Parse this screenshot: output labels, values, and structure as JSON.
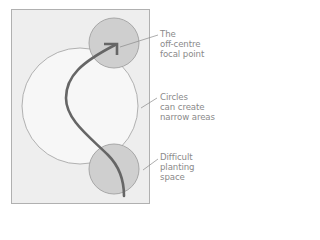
{
  "diagram": {
    "colors": {
      "background": "#ffffff",
      "frame_fill": "#eeeeee",
      "frame_stroke": "#b0b0b0",
      "large_circle_fill": "#f7f7f7",
      "large_circle_stroke": "#a8a8a8",
      "small_circle_fill": "#cfcfcf",
      "small_circle_stroke": "#a0a0a0",
      "path_stroke": "#666666",
      "leader_stroke": "#8a8a8a",
      "label_text": "#8a8a8a"
    },
    "shapes": {
      "frame": {
        "x": 11,
        "y": 9,
        "width": 138,
        "height": 194
      },
      "large_circle": {
        "cx": 80,
        "cy": 106,
        "r": 58
      },
      "top_circle": {
        "cx": 114,
        "cy": 43,
        "r": 25
      },
      "bottom_circle": {
        "cx": 114,
        "cy": 169,
        "r": 25
      }
    },
    "path": {
      "description": "curving garden path ending in arrowhead at focal point",
      "arrow_icon": "arrowhead"
    },
    "labels": [
      {
        "id": "focal-point",
        "lines": [
          "The",
          "off-centre",
          "focal point"
        ]
      },
      {
        "id": "narrow-areas",
        "lines": [
          "Circles",
          "can create",
          "narrow areas"
        ]
      },
      {
        "id": "difficult-planting",
        "lines": [
          "Difficult",
          "planting",
          "space"
        ]
      }
    ]
  }
}
